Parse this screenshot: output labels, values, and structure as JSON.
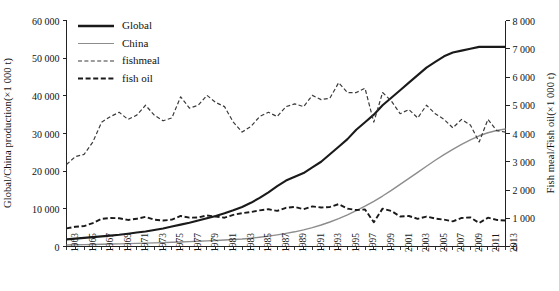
{
  "chart_data": {
    "type": "line",
    "title": "",
    "xlabel": "",
    "ylabel": "Global/China production(×1 000 t)",
    "ylabel_right": "Fish meal/Fish oil(×1 000 t)",
    "grid": false,
    "legend_position": "top-left",
    "xlim": [
      1963,
      2013
    ],
    "ylim": [
      0,
      60000
    ],
    "ylim_right": [
      0,
      8000
    ],
    "ytick_labels": [
      "0",
      "10 000",
      "20 000",
      "30 000",
      "40 000",
      "50 000",
      "60 000"
    ],
    "ytick_values": [
      0,
      10000,
      20000,
      30000,
      40000,
      50000,
      60000
    ],
    "ytick_right_labels": [
      "0",
      "1 000",
      "2 000",
      "3 000",
      "4 000",
      "5 000",
      "6 000",
      "7 000",
      "8 000"
    ],
    "ytick_right_values": [
      0,
      1000,
      2000,
      3000,
      4000,
      5000,
      6000,
      7000,
      8000
    ],
    "xtick_labels": [
      "1963",
      "1965",
      "1967",
      "1969",
      "1971",
      "1973",
      "1975",
      "1977",
      "1979",
      "1981",
      "1983",
      "1985",
      "1987",
      "1989",
      "1991",
      "1993",
      "1995",
      "1997",
      "1999",
      "2001",
      "2003",
      "2005",
      "2007",
      "2009",
      "2011",
      "2013"
    ],
    "x": [
      1963,
      1964,
      1965,
      1966,
      1967,
      1968,
      1969,
      1970,
      1971,
      1972,
      1973,
      1974,
      1975,
      1976,
      1977,
      1978,
      1979,
      1980,
      1981,
      1982,
      1983,
      1984,
      1985,
      1986,
      1987,
      1988,
      1989,
      1990,
      1991,
      1992,
      1993,
      1994,
      1995,
      1996,
      1997,
      1998,
      1999,
      2000,
      2001,
      2002,
      2003,
      2004,
      2005,
      2006,
      2007,
      2008,
      2009,
      2010,
      2011,
      2012,
      2013
    ],
    "series": [
      {
        "name": "Global",
        "axis": "left",
        "color": "#1a1a1a",
        "style": "solid",
        "width": 2.1,
        "values": [
          2300,
          2500,
          2700,
          2900,
          3100,
          3300,
          3500,
          3700,
          3900,
          4200,
          4500,
          4800,
          5200,
          5600,
          6000,
          6400,
          6900,
          7400,
          8000,
          8700,
          9500,
          10500,
          11700,
          13000,
          14500,
          16000,
          17000,
          18000,
          19500,
          21000,
          23000,
          25000,
          27000,
          29500,
          31500,
          33500,
          36000,
          38000,
          40000,
          42000,
          44000,
          46000,
          48000,
          50000,
          52000,
          53000,
          55000,
          57000,
          59000,
          61500,
          64000
        ],
        "values_plotted": [
          1900,
          2100,
          2300,
          2500,
          2700,
          2900,
          3100,
          3400,
          3700,
          4000,
          4400,
          4800,
          5300,
          5800,
          6300,
          6900,
          7500,
          8100,
          8800,
          9600,
          10500,
          11600,
          12900,
          14400,
          16000,
          17500,
          18500,
          19500,
          21000,
          22500,
          24500,
          26500,
          28500,
          31000,
          33000,
          35000,
          37500,
          39500,
          41500,
          43500,
          45500,
          47500,
          49000,
          50500,
          51500,
          52000,
          52500,
          53000,
          53000,
          53000,
          53000
        ]
      },
      {
        "name": "China",
        "axis": "left",
        "color": "#8d8d8d",
        "style": "solid",
        "width": 1.4,
        "values": [
          400,
          450,
          500,
          550,
          600,
          650,
          700,
          760,
          820,
          890,
          960,
          1040,
          1120,
          1210,
          1300,
          1400,
          1500,
          1610,
          1730,
          1860,
          2000,
          2200,
          2450,
          2750,
          3100,
          3500,
          3900,
          4400,
          5000,
          5700,
          6500,
          7400,
          8400,
          9500,
          10700,
          12000,
          13400,
          14900,
          16500,
          18100,
          19700,
          21300,
          22900,
          24400,
          25800,
          27100,
          28300,
          29400,
          30200,
          30800,
          31200
        ]
      },
      {
        "name": "fishmeal",
        "axis": "right",
        "color": "#3a3a3a",
        "style": "dashed-fine",
        "width": 1.2,
        "values": [
          2900,
          3180,
          3260,
          3700,
          4400,
          4600,
          4750,
          4500,
          4650,
          5000,
          4650,
          4450,
          4550,
          5300,
          4900,
          5000,
          5350,
          5100,
          4950,
          4400,
          4050,
          4250,
          4600,
          4750,
          4600,
          4950,
          5050,
          4950,
          5350,
          5200,
          5250,
          5800,
          5450,
          5450,
          5600,
          4400,
          5450,
          5150,
          4700,
          4850,
          4550,
          5000,
          4700,
          4500,
          4200,
          4500,
          4300,
          3700,
          4500,
          4100,
          4050
        ]
      },
      {
        "name": "fish oil",
        "axis": "right",
        "color": "#1a1a1a",
        "style": "dashed-bold",
        "width": 1.9,
        "values": [
          640,
          700,
          720,
          830,
          980,
          1010,
          1000,
          940,
          980,
          1050,
          950,
          920,
          950,
          1080,
          1020,
          1030,
          1100,
          1060,
          1020,
          1120,
          1180,
          1220,
          1280,
          1320,
          1260,
          1370,
          1400,
          1320,
          1420,
          1380,
          1400,
          1500,
          1340,
          1290,
          1310,
          860,
          1340,
          1260,
          1060,
          1080,
          980,
          1060,
          990,
          950,
          890,
          1010,
          1030,
          830,
          1020,
          940,
          920
        ]
      }
    ],
    "legend": [
      {
        "label": "Global",
        "style": "solid-bold",
        "color": "#1a1a1a"
      },
      {
        "label": "China",
        "style": "solid-thin",
        "color": "#8d8d8d"
      },
      {
        "label": "fishmeal",
        "style": "dashed-fine",
        "color": "#3a3a3a"
      },
      {
        "label": "fish oil",
        "style": "dashed-bold",
        "color": "#1a1a1a"
      }
    ]
  }
}
